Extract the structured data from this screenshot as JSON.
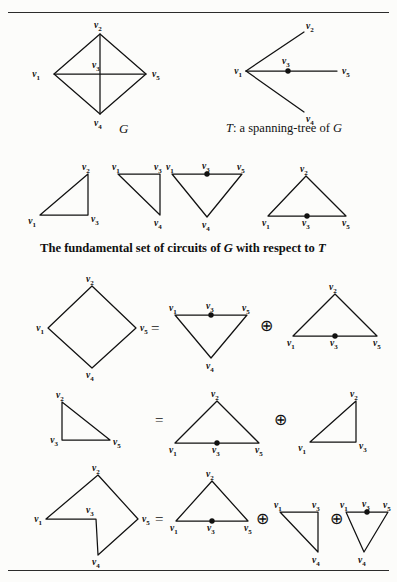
{
  "page": {
    "width": 397,
    "height": 582,
    "background": "#fcfcfa",
    "ink": "#111111"
  },
  "rules": {
    "top_label": "top-horizontal-rule",
    "bottom_label": "bottom-horizontal-rule"
  },
  "vertices": {
    "v1": "v",
    "v1_sub": "1",
    "v2": "v",
    "v2_sub": "2",
    "v3": "v",
    "v3_sub": "3",
    "v4": "v",
    "v4_sub": "4",
    "v5": "v",
    "v5_sub": "5"
  },
  "operators": {
    "equals": "=",
    "ringsum": "⊕"
  },
  "captions": {
    "graph_g": "G",
    "spanning_tree_prefix": "T",
    "spanning_tree_rest": ": a spanning-tree of ",
    "spanning_tree_suffix": "G",
    "fundamental_set_a": "The fundamental set of circuits of ",
    "fundamental_set_g": "G",
    "fundamental_set_b": " with respect to ",
    "fundamental_set_t": "T"
  },
  "figures": {
    "graph_G": {
      "name": "graph-g-diamond",
      "description": "Graph G drawn as a diamond with vertices v2 top, v1 left, v5 right, v4 bottom, plus crossing diagonals meeting at v3",
      "labels": [
        "v2",
        "v1",
        "v3",
        "v5",
        "v4"
      ]
    },
    "tree_T": {
      "name": "spanning-tree-t",
      "description": "Spanning tree T: v1 connects to v2, v3 and v4; v3 connects to v5. v3 is marked with a solid dot.",
      "labels": [
        "v2",
        "v1",
        "v3",
        "v5",
        "v4"
      ]
    },
    "circuit_1": {
      "name": "fundamental-circuit-1",
      "description": "Triangle v1 - v2 - v3",
      "labels": [
        "v2",
        "v1",
        "v3"
      ]
    },
    "circuit_2": {
      "name": "fundamental-circuit-2",
      "description": "Triangle v1 - v3 - v4",
      "labels": [
        "v1",
        "v3",
        "v4"
      ]
    },
    "circuit_3": {
      "name": "fundamental-circuit-3",
      "description": "Inverted triangle v1 - v3 - v5 - v4 with dot at v3",
      "labels": [
        "v1",
        "v3",
        "v5",
        "v4"
      ]
    },
    "circuit_4": {
      "name": "fundamental-circuit-4",
      "description": "Triangle v2 apex over base v1 - v3 - v5 with dot at v3",
      "labels": [
        "v2",
        "v1",
        "v3",
        "v5"
      ]
    },
    "eq1_lhs": {
      "name": "equation-1-lhs-diamond",
      "description": "Diamond circuit v1 v2 v5 v4",
      "labels": [
        "v2",
        "v1",
        "v5",
        "v4"
      ]
    },
    "eq1_term1": {
      "name": "equation-1-term-1",
      "description": "Inverted triangle v1 - v3 - v5 - v4 with dot at v3",
      "labels": [
        "v1",
        "v3",
        "v5",
        "v4"
      ]
    },
    "eq1_term2": {
      "name": "equation-1-term-2",
      "description": "Triangle v2 apex over base v1 - v3 - v5 with dot at v3",
      "labels": [
        "v2",
        "v1",
        "v3",
        "v5"
      ]
    },
    "eq2_lhs": {
      "name": "equation-2-lhs-triangle",
      "description": "Triangle v2 top-left, v3 bottom-left, v5 bottom-right",
      "labels": [
        "v2",
        "v3",
        "v5"
      ]
    },
    "eq2_term1": {
      "name": "equation-2-term-1",
      "description": "Triangle v2 apex over base v1 - v3 - v5 with dot at v3",
      "labels": [
        "v2",
        "v1",
        "v3",
        "v5"
      ]
    },
    "eq2_term2": {
      "name": "equation-2-term-2",
      "description": "Triangle v1 - v2 - v3",
      "labels": [
        "v2",
        "v1",
        "v3"
      ]
    },
    "eq3_lhs": {
      "name": "equation-3-lhs-arrowhead",
      "description": "Non-convex figure: v1 - v2 - v5 - v4 - v3 - v1 with v3 re-entrant",
      "labels": [
        "v2",
        "v1",
        "v3",
        "v5",
        "v4"
      ]
    },
    "eq3_term1": {
      "name": "equation-3-term-1",
      "description": "Triangle v2 apex over base v1 - v3 - v5 with dot at v3",
      "labels": [
        "v2",
        "v1",
        "v3",
        "v5"
      ]
    },
    "eq3_term2": {
      "name": "equation-3-term-2",
      "description": "Triangle v1 - v3 - v4",
      "labels": [
        "v1",
        "v3",
        "v4"
      ]
    },
    "eq3_term3": {
      "name": "equation-3-term-3",
      "description": "Inverted triangle v1 - v3 - v5 - v4 with dot at v3",
      "labels": [
        "v1",
        "v3",
        "v5",
        "v4"
      ]
    }
  }
}
